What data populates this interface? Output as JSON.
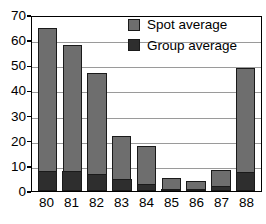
{
  "chart_data": {
    "type": "bar",
    "title": "",
    "subtitle": "",
    "xlabel": "",
    "ylabel": "",
    "stacked": true,
    "grid": true,
    "legend_position": "top-right",
    "ylim": [
      0,
      70
    ],
    "yticks": [
      0,
      10,
      20,
      30,
      40,
      50,
      60,
      70
    ],
    "categories": [
      "80",
      "81",
      "82",
      "83",
      "84",
      "85",
      "86",
      "87",
      "88"
    ],
    "series": [
      {
        "name": "Spot average",
        "color": "#6e6e6e",
        "values": [
          65,
          58,
          47,
          22,
          18,
          5,
          4,
          8.5,
          49
        ]
      },
      {
        "name": "Group average",
        "color": "#2e2e2e",
        "values": [
          8,
          8,
          7,
          5,
          3,
          1,
          1,
          2,
          7.5
        ]
      }
    ]
  },
  "legend": {
    "items": [
      {
        "label": "Spot average",
        "color": "#6e6e6e"
      },
      {
        "label": "Group average",
        "color": "#2e2e2e"
      }
    ]
  },
  "axes": {
    "y_tick_labels": [
      "70",
      "60",
      "50",
      "40",
      "30",
      "20",
      "10",
      "0"
    ],
    "x_tick_labels": [
      "80",
      "81",
      "82",
      "83",
      "84",
      "85",
      "86",
      "87",
      "88"
    ]
  }
}
